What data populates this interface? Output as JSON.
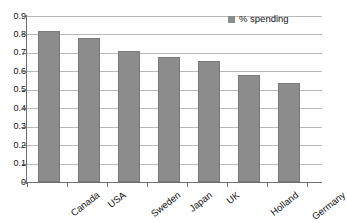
{
  "chart_data": {
    "type": "bar",
    "title": "",
    "xlabel": "",
    "ylabel": "",
    "categories": [
      "Canada",
      "USA",
      "Sweden",
      "Japan",
      "UK",
      "Holland",
      "Germany"
    ],
    "values": [
      0.82,
      0.78,
      0.71,
      0.68,
      0.655,
      0.58,
      0.535
    ],
    "series": [
      {
        "name": "% spending",
        "values": [
          0.82,
          0.78,
          0.71,
          0.68,
          0.655,
          0.58,
          0.535
        ],
        "color": "#8c8c8c"
      }
    ],
    "ylim": [
      0,
      0.9
    ],
    "ytick_labels": [
      "0.9",
      "0.8",
      "0.7",
      "0.6",
      "0.5",
      "0.4",
      "0.3",
      "0.2",
      "0.1",
      "0"
    ],
    "ytick_values": [
      0.9,
      0.8,
      0.7,
      0.6,
      0.5,
      0.4,
      0.3,
      0.2,
      0.1,
      0
    ],
    "grid": true,
    "legend": {
      "position": "top-right",
      "entries": [
        {
          "label": "% spending",
          "color": "#8c8c8c",
          "marker": "square-swatch"
        }
      ]
    }
  },
  "colors": {
    "bar": "#8c8c8c",
    "bar_edge": "#7a7a7a",
    "grid": "#b8b8b8",
    "axis": "#6e6e6e",
    "text": "#111111",
    "background": "#ffffff"
  }
}
